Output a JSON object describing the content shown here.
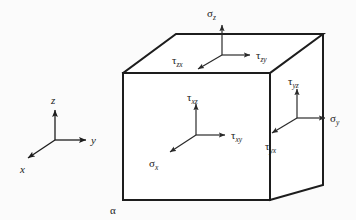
{
  "figure": {
    "background_color": "#fbfbfb",
    "line_color": "#1d1d1d",
    "text_color": "#1a1a1a",
    "corner_label": "α"
  },
  "axes": {
    "name": "coordinate-triad",
    "origin": {
      "x": 55,
      "y": 140
    },
    "labels": {
      "z": "z",
      "y": "y",
      "x": "x"
    },
    "directions": {
      "z": "up",
      "y": "right",
      "x": "down-left"
    }
  },
  "cube": {
    "front_face": {
      "name": "front-face",
      "normal": "x",
      "origin": {
        "x": 196,
        "y": 135
      },
      "vectors": [
        {
          "symbol": "τ",
          "subscript": "xz",
          "label": "τxz",
          "direction": "up",
          "name": "tau-xz"
        },
        {
          "symbol": "τ",
          "subscript": "xy",
          "label": "τxy",
          "direction": "right",
          "name": "tau-xy"
        },
        {
          "symbol": "σ",
          "subscript": "x",
          "label": "σx",
          "direction": "down-left",
          "name": "sigma-x"
        }
      ]
    },
    "top_face": {
      "name": "top-face",
      "normal": "z",
      "origin": {
        "x": 222,
        "y": 55
      },
      "vectors": [
        {
          "symbol": "σ",
          "subscript": "z",
          "label": "σz",
          "direction": "up",
          "name": "sigma-z"
        },
        {
          "symbol": "τ",
          "subscript": "zy",
          "label": "τzy",
          "direction": "right",
          "name": "tau-zy"
        },
        {
          "symbol": "τ",
          "subscript": "zx",
          "label": "τzx",
          "direction": "down-left",
          "name": "tau-zx"
        }
      ]
    },
    "right_face": {
      "name": "right-face",
      "normal": "y",
      "origin": {
        "x": 297,
        "y": 118
      },
      "vectors": [
        {
          "symbol": "τ",
          "subscript": "yz",
          "label": "τyz",
          "direction": "up",
          "name": "tau-yz"
        },
        {
          "symbol": "σ",
          "subscript": "y",
          "label": "σy",
          "direction": "right",
          "name": "sigma-y"
        },
        {
          "symbol": "τ",
          "subscript": "yx",
          "label": "τyx",
          "direction": "down-left",
          "name": "tau-yx"
        }
      ]
    },
    "geometry": {
      "front_top_left": {
        "x": 123,
        "y": 73
      },
      "front_top_right": {
        "x": 270,
        "y": 73
      },
      "front_bottom_left": {
        "x": 123,
        "y": 200
      },
      "front_bottom_right": {
        "x": 270,
        "y": 200
      },
      "back_top_left": {
        "x": 176,
        "y": 34
      },
      "back_top_right": {
        "x": 323,
        "y": 34
      },
      "back_bottom_right": {
        "x": 323,
        "y": 185
      }
    }
  },
  "symbols": {
    "sigma_z": {
      "base": "σ",
      "sub": "z"
    },
    "tau_zy": {
      "base": "τ",
      "sub": "zy"
    },
    "tau_zx": {
      "base": "τ",
      "sub": "zx"
    },
    "tau_xz": {
      "base": "τ",
      "sub": "xz"
    },
    "tau_xy": {
      "base": "τ",
      "sub": "xy"
    },
    "sigma_x": {
      "base": "σ",
      "sub": "x"
    },
    "tau_yz": {
      "base": "τ",
      "sub": "yz"
    },
    "sigma_y": {
      "base": "σ",
      "sub": "y"
    },
    "tau_yx": {
      "base": "τ",
      "sub": "yx"
    },
    "axis_z": {
      "base": "z",
      "sub": ""
    },
    "axis_y": {
      "base": "y",
      "sub": ""
    },
    "axis_x": {
      "base": "x",
      "sub": ""
    },
    "corner_alpha": {
      "base": "α",
      "sub": ""
    }
  }
}
